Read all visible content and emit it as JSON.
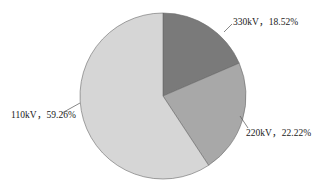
{
  "chart_data": {
    "type": "pie",
    "title": "",
    "categories": [
      "330kV",
      "220kV",
      "110kV"
    ],
    "values": [
      18.52,
      22.22,
      59.26
    ],
    "unit": "%",
    "labels": [
      "330kV，18.52%",
      "220kV，22.22%",
      "110kV，59.26%"
    ],
    "colors": [
      "#7a7a7a",
      "#a8a8a8",
      "#d6d6d6"
    ],
    "start_angle": "12 o'clock",
    "direction": "clockwise",
    "legend": "none (data labels with leader lines)"
  },
  "labels": {
    "kv330": "330kV，18.52%",
    "kv220": "220kV，22.22%",
    "kv110": "110kV，59.26%"
  }
}
